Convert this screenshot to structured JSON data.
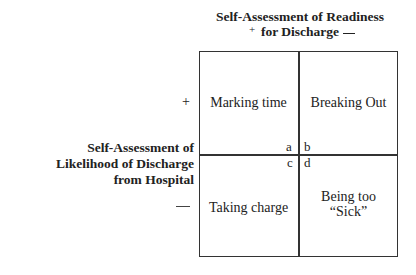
{
  "diagram": {
    "type": "2x2 matrix",
    "top_axis": {
      "title_line1": "Self-Assessment of Readiness",
      "title_line2": "for Discharge",
      "plus": "+",
      "minus": "—"
    },
    "left_axis": {
      "title_line1": "Self-Assessment of",
      "title_line2": "Likelihood of Discharge",
      "title_line3": "from Hospital",
      "plus": "+",
      "minus": "—"
    },
    "quadrants": [
      {
        "letter": "a",
        "label": "Marking time"
      },
      {
        "letter": "b",
        "label": "Breaking Out"
      },
      {
        "letter": "c",
        "label": "Taking charge"
      },
      {
        "letter": "d",
        "label_line1": "Being too",
        "label_line2": "“Sick”"
      }
    ]
  }
}
